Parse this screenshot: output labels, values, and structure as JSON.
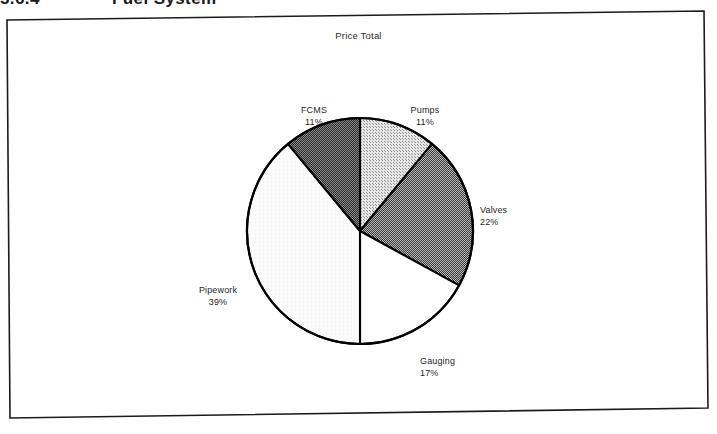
{
  "page": {
    "section_number": "5.6.4",
    "section_heading": "Fuel System"
  },
  "chart": {
    "title": "Price Total",
    "frame_color": "#1b1b1b",
    "outline_color": "#000000"
  },
  "labels": {
    "fcms": {
      "name": "FCMS",
      "pct": "11%"
    },
    "pumps": {
      "name": "Pumps",
      "pct": "11%"
    },
    "valves": {
      "name": "Valves",
      "pct": "22%"
    },
    "gauging": {
      "name": "Gauging",
      "pct": "17%"
    },
    "pipework": {
      "name": "Pipework",
      "pct": "39%"
    }
  },
  "chart_data": {
    "type": "pie",
    "title": "Price Total",
    "subtitle": "",
    "xlabel": "",
    "ylabel": "",
    "legend_position": "none",
    "labels_position": "outside-callout",
    "start_angle_deg": 0,
    "direction": "clockwise",
    "categories": [
      "Pumps",
      "Valves",
      "Gauging",
      "Pipework",
      "FCMS"
    ],
    "values": [
      11,
      22,
      17,
      39,
      11
    ],
    "value_unit": "percent",
    "slices": [
      {
        "label": "Pumps",
        "value": 11,
        "display": "11%",
        "fill": "#c0c0c0",
        "pattern": "light-stipple",
        "start_deg": 0,
        "end_deg": 39.6
      },
      {
        "label": "Valves",
        "value": 22,
        "display": "22%",
        "fill": "#7a7a7a",
        "pattern": "medium-dither",
        "start_deg": 39.6,
        "end_deg": 118.8
      },
      {
        "label": "Gauging",
        "value": 17,
        "display": "17%",
        "fill": "#ffffff",
        "pattern": "solid-white",
        "start_deg": 118.8,
        "end_deg": 180.0
      },
      {
        "label": "Pipework",
        "value": 39,
        "display": "39%",
        "fill": "#f2f2f2",
        "pattern": "very-light",
        "start_deg": 180.0,
        "end_deg": 320.4
      },
      {
        "label": "FCMS",
        "value": 11,
        "display": "11%",
        "fill": "#4a4a4a",
        "pattern": "dark-dither",
        "start_deg": 320.4,
        "end_deg": 360.0
      }
    ]
  }
}
